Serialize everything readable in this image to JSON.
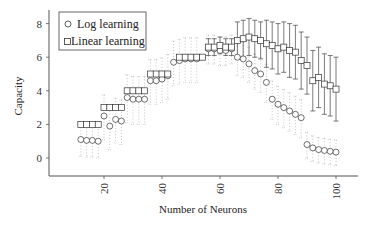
{
  "chart_data": {
    "type": "scatter",
    "title": "",
    "xlabel": "Number of Neurons",
    "ylabel": "Capacity",
    "xlim": [
      5,
      108
    ],
    "ylim": [
      -1,
      9
    ],
    "xticks": [
      20,
      40,
      60,
      80,
      100
    ],
    "yticks": [
      0,
      2,
      4,
      6,
      8
    ],
    "grid": false,
    "legend_position": "upper left",
    "series": [
      {
        "name": "Log learning",
        "marker": "circle",
        "x": [
          12,
          14,
          16,
          18,
          20,
          22,
          24,
          26,
          28,
          30,
          32,
          34,
          36,
          38,
          40,
          42,
          44,
          46,
          48,
          50,
          52,
          56,
          58,
          60,
          62,
          64,
          66,
          68,
          70,
          72,
          74,
          76,
          78,
          80,
          82,
          84,
          86,
          88,
          90,
          92,
          94,
          96,
          98,
          100
        ],
        "y": [
          1.1,
          1.05,
          1.05,
          1.0,
          2.5,
          1.9,
          2.3,
          2.2,
          3.6,
          3.5,
          3.5,
          3.5,
          4.6,
          4.6,
          4.7,
          4.9,
          5.7,
          5.8,
          5.9,
          5.9,
          5.9,
          6.5,
          6.5,
          6.4,
          6.4,
          6.5,
          6.0,
          5.9,
          5.6,
          5.2,
          5.0,
          4.5,
          3.5,
          3.2,
          3.0,
          2.8,
          2.6,
          2.4,
          0.8,
          0.6,
          0.5,
          0.45,
          0.4,
          0.35
        ],
        "spread": [
          1.0,
          1.0,
          1.0,
          1.0,
          1.4,
          1.4,
          1.4,
          1.4,
          1.5,
          1.5,
          1.5,
          1.5,
          1.4,
          1.4,
          1.4,
          1.4,
          1.4,
          1.4,
          1.4,
          1.4,
          1.4,
          0.9,
          0.9,
          0.9,
          0.9,
          0.9,
          1.1,
          1.1,
          1.1,
          1.1,
          1.1,
          1.2,
          1.2,
          1.2,
          1.2,
          1.2,
          1.2,
          1.2,
          0.8,
          0.8,
          0.8,
          0.8,
          0.8,
          0.8
        ]
      },
      {
        "name": "Linear learning",
        "marker": "square",
        "x": [
          12,
          14,
          16,
          18,
          20,
          22,
          24,
          26,
          28,
          30,
          32,
          34,
          36,
          38,
          40,
          42,
          46,
          48,
          50,
          52,
          54,
          56,
          58,
          60,
          62,
          64,
          66,
          68,
          70,
          72,
          74,
          76,
          78,
          80,
          82,
          84,
          86,
          88,
          90,
          92,
          94,
          96,
          98,
          100
        ],
        "y": [
          2,
          2,
          2,
          2,
          3,
          3,
          3,
          3,
          4,
          4,
          4,
          4,
          5,
          5,
          5,
          5,
          6,
          6,
          6,
          6,
          6,
          6.6,
          6.6,
          6.7,
          6.6,
          6.6,
          7.0,
          7.1,
          7.2,
          7.1,
          7.0,
          6.8,
          6.7,
          6.5,
          6.6,
          6.4,
          6.3,
          5.8,
          5.5,
          4.6,
          4.8,
          4.4,
          4.3,
          4.1
        ],
        "err": [
          0,
          0,
          0,
          0,
          0,
          0,
          0,
          0,
          0,
          0,
          0,
          0,
          0,
          0,
          0,
          0,
          0,
          0,
          0,
          0,
          0,
          0.5,
          0.5,
          0.5,
          0.5,
          0.5,
          1.1,
          1.1,
          1.1,
          1.1,
          1.1,
          1.4,
          1.4,
          1.5,
          1.5,
          1.6,
          1.6,
          1.7,
          1.7,
          1.8,
          1.8,
          1.8,
          1.8,
          1.9
        ]
      }
    ],
    "colors": {
      "axis": "#555555",
      "marker": "#333333",
      "errorbar": "#444444",
      "spread": "#aaaaaa"
    }
  },
  "axes": {
    "xlabel": "Number of Neurons",
    "ylabel": "Capacity",
    "xtick_labels": [
      "20",
      "40",
      "60",
      "80",
      "100"
    ],
    "ytick_labels": [
      "0",
      "2",
      "4",
      "6",
      "8"
    ]
  },
  "legend": {
    "items": [
      {
        "label": "Log learning",
        "marker": "circle"
      },
      {
        "label": "Linear learning",
        "marker": "square"
      }
    ]
  }
}
